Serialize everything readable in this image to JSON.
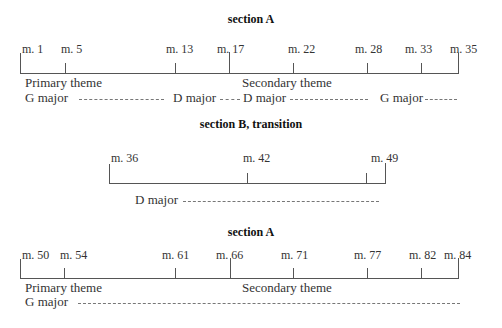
{
  "sections": [
    {
      "title": "section A",
      "measures": [
        "m. 1",
        "m. 5",
        "m. 13",
        "m. 17",
        "m. 22",
        "m. 28",
        "m. 33",
        "m. 35"
      ],
      "themes": [
        "Primary theme",
        "Secondary theme"
      ],
      "keys": [
        "G major",
        "D major",
        "D major",
        "G major"
      ]
    },
    {
      "title": "section B, transition",
      "measures": [
        "m. 36",
        "m. 42",
        "m. 49"
      ],
      "keys": [
        "D major"
      ]
    },
    {
      "title": "section A",
      "measures": [
        "m. 50",
        "m. 54",
        "m. 61",
        "m. 66",
        "m. 71",
        "m. 77",
        "m. 82",
        "m. 84"
      ],
      "themes": [
        "Primary theme",
        "Secondary theme"
      ],
      "keys": [
        "G major"
      ]
    }
  ]
}
